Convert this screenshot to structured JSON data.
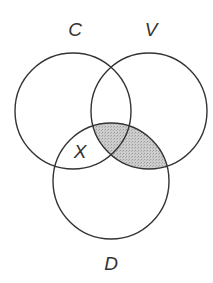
{
  "diagram": {
    "type": "venn",
    "sets": [
      {
        "id": "C",
        "label": "C",
        "cx": 73,
        "cy": 111,
        "r": 58
      },
      {
        "id": "V",
        "label": "V",
        "cx": 149,
        "cy": 111,
        "r": 58
      },
      {
        "id": "D",
        "label": "D",
        "cx": 111,
        "cy": 181,
        "r": 58
      }
    ],
    "region_labels": [
      {
        "label": "X",
        "region": "C ∩ D only"
      }
    ],
    "shaded_region": "V ∩ D",
    "colors": {
      "stroke": "#333333",
      "shade": "#c4c4c4",
      "background": "#ffffff"
    }
  }
}
